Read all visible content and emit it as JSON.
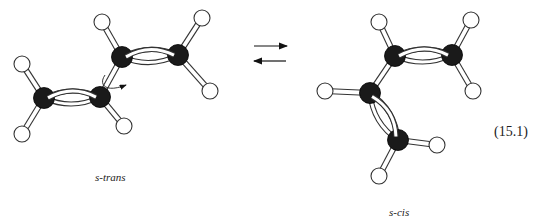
{
  "equation_number": "(15.1)",
  "colors": {
    "carbon": "#1a1a1a",
    "hydrogen_fill": "#ffffff",
    "outline": "#333333",
    "bond_fill": "#ffffff"
  },
  "molecules": [
    {
      "name": "s-trans",
      "label": "s-trans",
      "carbons": [
        [
          44,
          98
        ],
        [
          100,
          97
        ],
        [
          122,
          57
        ],
        [
          178,
          55
        ]
      ],
      "hydrogens": [
        [
          22,
          64
        ],
        [
          22,
          134
        ],
        [
          124,
          126
        ],
        [
          102,
          22
        ],
        [
          202,
          18
        ],
        [
          210,
          91
        ]
      ],
      "double_bonds": [
        [
          0,
          1
        ],
        [
          2,
          3
        ]
      ],
      "single_bonds": [
        [
          1,
          2
        ]
      ],
      "ch_bonds": [
        [
          0,
          0
        ],
        [
          0,
          1
        ],
        [
          1,
          2
        ],
        [
          2,
          3
        ],
        [
          3,
          4
        ],
        [
          3,
          5
        ]
      ],
      "rotation_arrow": true
    },
    {
      "name": "s-cis",
      "label": "s-cis",
      "carbons": [
        [
          395,
          56
        ],
        [
          452,
          55
        ],
        [
          370,
          93
        ],
        [
          398,
          140
        ]
      ],
      "hydrogens": [
        [
          379,
          22
        ],
        [
          471,
          20
        ],
        [
          473,
          91
        ],
        [
          325,
          91
        ],
        [
          437,
          145
        ],
        [
          379,
          176
        ]
      ],
      "double_bonds": [
        [
          0,
          1
        ],
        [
          2,
          3
        ]
      ],
      "single_bonds": [
        [
          0,
          2
        ]
      ],
      "ch_bonds": [
        [
          0,
          0
        ],
        [
          1,
          1
        ],
        [
          1,
          2
        ],
        [
          2,
          3
        ],
        [
          3,
          4
        ],
        [
          3,
          5
        ]
      ]
    }
  ],
  "equilibrium_arrows": {
    "forward": {
      "x1": 254,
      "x2": 287,
      "y": 46
    },
    "reverse": {
      "x1": 286,
      "x2": 254,
      "y": 61
    }
  }
}
